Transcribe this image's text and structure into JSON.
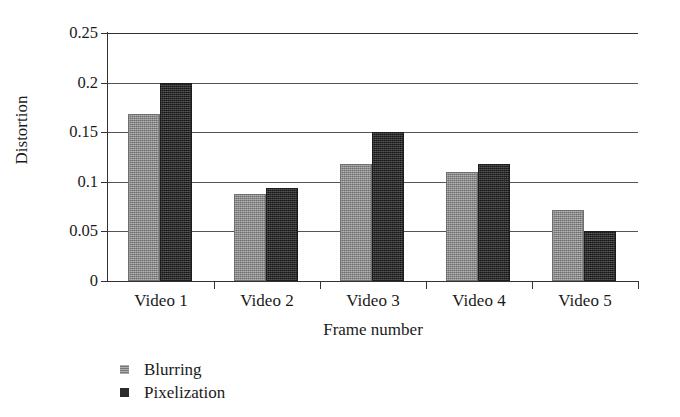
{
  "chart_data": {
    "type": "bar",
    "title": "",
    "xlabel": "Frame number",
    "ylabel": "Distortion",
    "categories": [
      "Video 1",
      "Video 2",
      "Video 3",
      "Video 4",
      "Video 5"
    ],
    "series": [
      {
        "name": "Blurring",
        "color": "#8c8c8c",
        "values": [
          0.168,
          0.088,
          0.118,
          0.11,
          0.072
        ]
      },
      {
        "name": "Pixelization",
        "color": "#2b2b2b",
        "values": [
          0.2,
          0.094,
          0.15,
          0.118,
          0.05
        ]
      }
    ],
    "ylim": [
      0,
      0.25
    ],
    "y_ticks": [
      0,
      0.05,
      0.1,
      0.15,
      0.2,
      0.25
    ],
    "y_tick_labels": [
      "0",
      "0.05",
      "0.1",
      "0.15",
      "0.2",
      "0.25"
    ],
    "grid": true,
    "grid_axis": "y",
    "legend_position": "bottom-left",
    "legend": [
      "Blurring",
      "Pixelization"
    ]
  }
}
